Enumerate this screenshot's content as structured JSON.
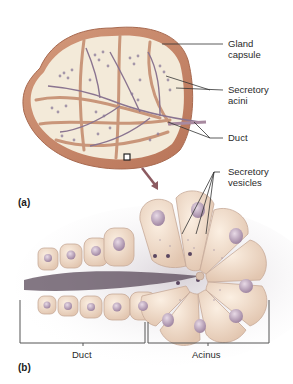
{
  "figure": {
    "panel_a": {
      "letter": "(a)",
      "labels": {
        "gland_capsule_line1": "Gland",
        "gland_capsule_line2": "capsule",
        "secretory_acini_line1": "Secretory",
        "secretory_acini_line2": "acini",
        "duct": "Duct"
      }
    },
    "panel_b": {
      "letter": "(b)",
      "labels": {
        "secretory_vesicles_line1": "Secretory",
        "secretory_vesicles_line2": "vesicles",
        "duct": "Duct",
        "acinus": "Acinus"
      }
    },
    "colors": {
      "capsule": "#c98a6a",
      "lobule_fill": "#f3ead9",
      "acini": "#8a7a9a",
      "duct": "#7a6a8a",
      "cell_fill": "#f0dcc8",
      "nucleus": "#b8a0b8",
      "lumen": "#5a4a5a",
      "arrow": "#c0504d",
      "leader": "#333333"
    }
  }
}
